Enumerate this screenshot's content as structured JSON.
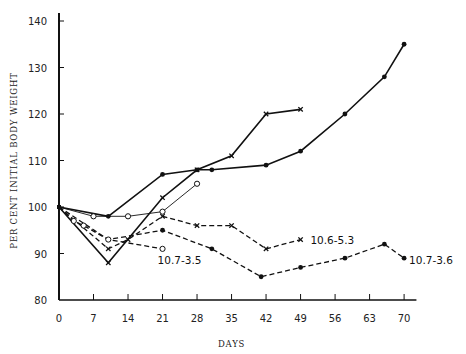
{
  "chart_data": {
    "type": "line",
    "title": "",
    "xlabel": "DAYS",
    "ylabel": "PER CENT INITIAL BODY WEIGHT",
    "xlim": [
      0,
      72
    ],
    "ylim": [
      80,
      140
    ],
    "x_ticks": [
      0,
      7,
      14,
      21,
      28,
      35,
      42,
      49,
      56,
      63,
      70
    ],
    "y_ticks": [
      80,
      90,
      100,
      110,
      120,
      130,
      140
    ],
    "grid": false,
    "legend": "none (inline labels)",
    "series": [
      {
        "name": "solid-dot",
        "style": "solid",
        "marker": "dot",
        "points": [
          [
            0,
            100
          ],
          [
            10,
            98
          ],
          [
            21,
            107
          ],
          [
            28,
            108
          ],
          [
            31,
            108
          ],
          [
            42,
            109
          ],
          [
            49,
            112
          ],
          [
            58,
            120
          ],
          [
            66,
            128
          ],
          [
            70,
            135
          ]
        ]
      },
      {
        "name": "solid-x",
        "style": "solid",
        "marker": "x",
        "points": [
          [
            0,
            100
          ],
          [
            10,
            88
          ],
          [
            21,
            102
          ],
          [
            28,
            108
          ],
          [
            35,
            111
          ],
          [
            42,
            120
          ],
          [
            49,
            121
          ]
        ]
      },
      {
        "name": "solid-open-circle",
        "style": "solid-thin",
        "marker": "open-circle",
        "points": [
          [
            0,
            100
          ],
          [
            7,
            98
          ],
          [
            14,
            98
          ],
          [
            21,
            99
          ],
          [
            28,
            105
          ]
        ]
      },
      {
        "name": "10.6-5.3",
        "style": "dashed",
        "marker": "x",
        "points": [
          [
            0,
            100
          ],
          [
            10,
            91
          ],
          [
            14,
            93
          ],
          [
            21,
            98
          ],
          [
            28,
            96
          ],
          [
            35,
            96
          ],
          [
            42,
            91
          ],
          [
            49,
            93
          ]
        ]
      },
      {
        "name": "10.7-3.6",
        "style": "dashed",
        "marker": "dot",
        "points": [
          [
            0,
            100
          ],
          [
            10,
            93
          ],
          [
            21,
            95
          ],
          [
            31,
            91
          ],
          [
            41,
            85
          ],
          [
            49,
            87
          ],
          [
            58,
            89
          ],
          [
            66,
            92
          ],
          [
            70,
            89
          ]
        ]
      },
      {
        "name": "10.7-3.5",
        "style": "dashed",
        "marker": "open-circle",
        "points": [
          [
            0,
            100
          ],
          [
            3,
            97
          ],
          [
            5,
            96
          ],
          [
            10,
            93
          ],
          [
            21,
            91
          ]
        ]
      }
    ],
    "annotations": [
      {
        "text": "10.6-5.3",
        "x": 51,
        "y": 93
      },
      {
        "text": "10.7-3.5",
        "x": 20,
        "y": 88.5
      },
      {
        "text": "10.7-3.6",
        "x": 71,
        "y": 88.5
      }
    ]
  }
}
